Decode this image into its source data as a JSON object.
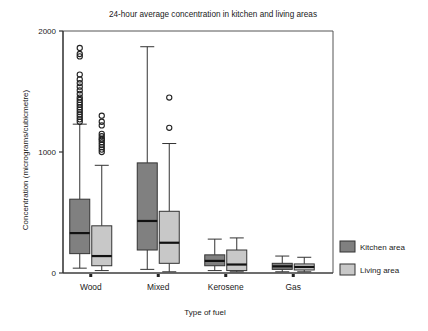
{
  "chart_data": {
    "type": "box",
    "title": "24-hour average concentration in kitchen and living areas",
    "xlabel": "Type of fuel",
    "ylabel": "Concentration (micrograms/cubicmetre)",
    "categories": [
      "Wood",
      "Mixed",
      "Kerosene",
      "Gas"
    ],
    "ylim": [
      0,
      2000
    ],
    "yticks": [
      0,
      1000,
      2000
    ],
    "ytick_labels": [
      "0",
      "1000",
      "2000"
    ],
    "grid": false,
    "legend_position": "right",
    "colors": {
      "kitchen": "#808080",
      "living": "#c8c8c8",
      "outline": "#333333",
      "median": "#111111",
      "axis": "#333333",
      "text": "#1a1a1a"
    },
    "series": [
      {
        "name": "Kitchen area",
        "key": "kitchen",
        "color": "#808080",
        "boxes": [
          {
            "category": "Wood",
            "whisker_low": 40,
            "q1": 160,
            "median": 330,
            "q3": 610,
            "whisker_high": 1230,
            "outliers": [
              1250,
              1270,
              1290,
              1310,
              1330,
              1350,
              1370,
              1390,
              1410,
              1430,
              1450,
              1480,
              1510,
              1540,
              1570,
              1600,
              1640,
              1790,
              1810,
              1860
            ]
          },
          {
            "category": "Mixed",
            "whisker_low": 30,
            "q1": 190,
            "median": 430,
            "q3": 910,
            "whisker_high": 1870,
            "outliers": []
          },
          {
            "category": "Kerosene",
            "whisker_low": 20,
            "q1": 60,
            "median": 100,
            "q3": 150,
            "whisker_high": 280,
            "outliers": []
          },
          {
            "category": "Gas",
            "whisker_low": 10,
            "q1": 30,
            "median": 55,
            "q3": 80,
            "whisker_high": 140,
            "outliers": []
          }
        ]
      },
      {
        "name": "Living area",
        "key": "living",
        "color": "#c8c8c8",
        "boxes": [
          {
            "category": "Wood",
            "whisker_low": 20,
            "q1": 60,
            "median": 140,
            "q3": 390,
            "whisker_high": 890,
            "outliers": [
              1000,
              1020,
              1040,
              1060,
              1080,
              1100,
              1110,
              1130,
              1150,
              1220,
              1250,
              1300
            ]
          },
          {
            "category": "Mixed",
            "whisker_low": 10,
            "q1": 80,
            "median": 250,
            "q3": 510,
            "whisker_high": 1070,
            "outliers": [
              1200,
              1450
            ]
          },
          {
            "category": "Kerosene",
            "whisker_low": 10,
            "q1": 20,
            "median": 70,
            "q3": 190,
            "whisker_high": 290,
            "outliers": []
          },
          {
            "category": "Gas",
            "whisker_low": 10,
            "q1": 25,
            "median": 50,
            "q3": 75,
            "whisker_high": 130,
            "outliers": []
          }
        ]
      }
    ],
    "legend": [
      {
        "label": "Kitchen area",
        "color": "#808080"
      },
      {
        "label": "Living area",
        "color": "#c8c8c8"
      }
    ]
  }
}
